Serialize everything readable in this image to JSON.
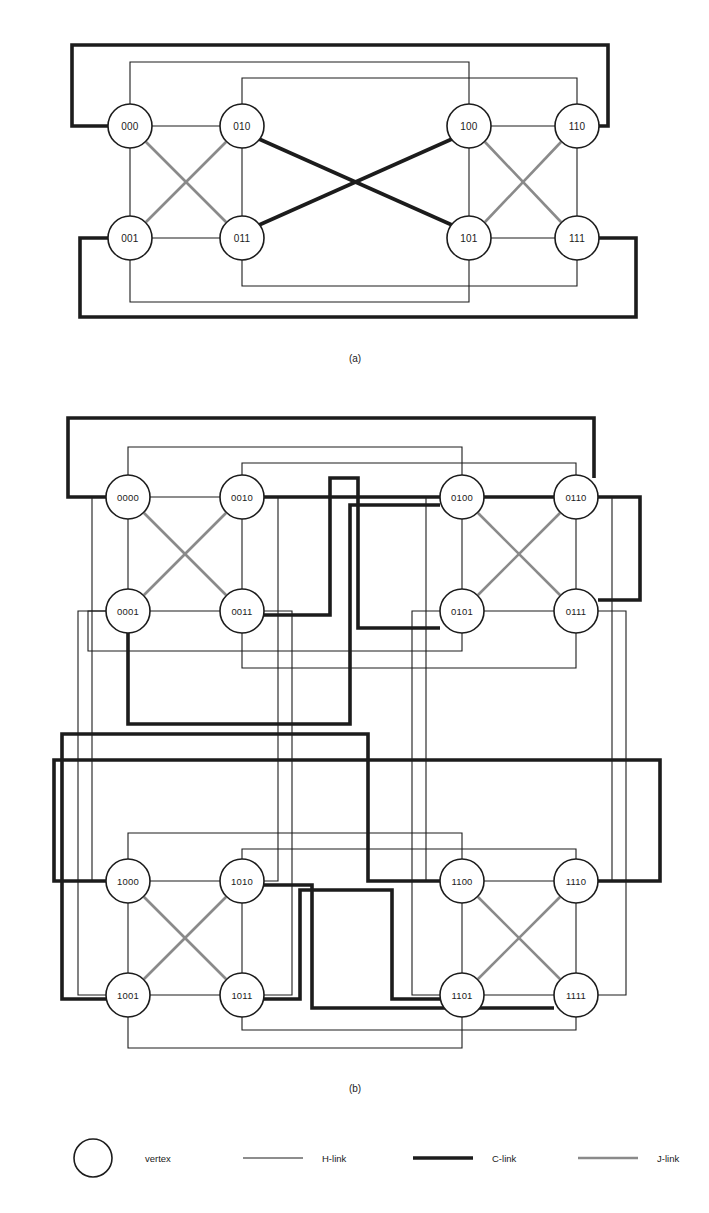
{
  "figure": {
    "captions": {
      "a": "(a)",
      "b": "(b)"
    }
  },
  "link_styles": {
    "H": {
      "name": "H-link",
      "color": "#1c1c1c",
      "width": 1.1
    },
    "C": {
      "name": "C-link",
      "color": "#1c1c1c",
      "width": 3.6
    },
    "J": {
      "name": "J-link",
      "color": "#8a8a8a",
      "width": 2.6
    }
  },
  "legend": {
    "items": [
      {
        "kind": "vertex",
        "label": "vertex"
      },
      {
        "kind": "H",
        "label": "H-link"
      },
      {
        "kind": "C",
        "label": "C-link"
      },
      {
        "kind": "J",
        "label": "J-link"
      }
    ],
    "y": 1158,
    "vertex": {
      "cx": 93,
      "cy": 1158,
      "r": 19
    },
    "vertex_label_x": 145,
    "samples": [
      {
        "kind": "H",
        "x1": 243,
        "x2": 303,
        "label_x": 322,
        "label": "H-link"
      },
      {
        "kind": "C",
        "x1": 413,
        "x2": 473,
        "label_x": 492,
        "label": "C-link"
      },
      {
        "kind": "J",
        "x1": 578,
        "x2": 638,
        "label_x": 657,
        "label": "J-link"
      }
    ]
  },
  "panel_a": {
    "caption": "(a)",
    "caption_x": 355,
    "caption_y": 362,
    "node_radius": 22,
    "nodes": [
      {
        "id": "000",
        "label": "000",
        "cx": 130,
        "cy": 126
      },
      {
        "id": "010",
        "label": "010",
        "cx": 242,
        "cy": 126
      },
      {
        "id": "001",
        "label": "001",
        "cx": 130,
        "cy": 238
      },
      {
        "id": "011",
        "label": "011",
        "cx": 242,
        "cy": 238
      },
      {
        "id": "100",
        "label": "100",
        "cx": 469,
        "cy": 126
      },
      {
        "id": "110",
        "label": "110",
        "cx": 577,
        "cy": 126
      },
      {
        "id": "101",
        "label": "101",
        "cx": 469,
        "cy": 238
      },
      {
        "id": "111",
        "label": "111",
        "cx": 577,
        "cy": 238
      }
    ],
    "links": [
      {
        "kind": "H",
        "from": "000",
        "to": "010",
        "points": "152,126 220,126"
      },
      {
        "kind": "H",
        "from": "000",
        "to": "001",
        "points": "130,148 130,216"
      },
      {
        "kind": "H",
        "from": "001",
        "to": "011",
        "points": "152,238 220,238"
      },
      {
        "kind": "H",
        "from": "010",
        "to": "011",
        "points": "242,148 242,216"
      },
      {
        "kind": "H",
        "from": "100",
        "to": "110",
        "points": "491,126 555,126"
      },
      {
        "kind": "H",
        "from": "100",
        "to": "101",
        "points": "469,148 469,216"
      },
      {
        "kind": "H",
        "from": "101",
        "to": "111",
        "points": "491,238 555,238"
      },
      {
        "kind": "H",
        "from": "110",
        "to": "111",
        "points": "577,148 577,216"
      },
      {
        "kind": "J",
        "from": "000",
        "to": "011",
        "points": "146,142 226,222"
      },
      {
        "kind": "J",
        "from": "010",
        "to": "001",
        "points": "226,142 146,222"
      },
      {
        "kind": "J",
        "from": "100",
        "to": "111",
        "points": "485,142 561,222"
      },
      {
        "kind": "J",
        "from": "110",
        "to": "101",
        "points": "561,142 485,222"
      },
      {
        "kind": "C",
        "from": "010",
        "to": "101",
        "points": "259,139 452,225"
      },
      {
        "kind": "C",
        "from": "011",
        "to": "100",
        "points": "259,225 452,139"
      },
      {
        "kind": "H",
        "from": "000",
        "to": "100",
        "points": "130,104 130,62 469,62 469,104"
      },
      {
        "kind": "H",
        "from": "010",
        "to": "110",
        "points": "242,104 242,78 577,78 577,104"
      },
      {
        "kind": "H",
        "from": "001",
        "to": "101",
        "points": "130,260 130,302 469,302 469,260"
      },
      {
        "kind": "H",
        "from": "011",
        "to": "111",
        "points": "242,260 242,286 577,286 577,260"
      },
      {
        "kind": "C",
        "from": "000",
        "to": "110",
        "points": "108,126 72,126 72,45 608,45 608,126 599,126"
      },
      {
        "kind": "C",
        "from": "001",
        "to": "111",
        "points": "108,238 80,238 80,317 636,317 636,238 599,238"
      }
    ]
  },
  "panel_b": {
    "caption": "(b)",
    "caption_x": 355,
    "caption_y": 1092,
    "node_radius": 22,
    "nodes": [
      {
        "id": "0000",
        "label": "0000",
        "cx": 128,
        "cy": 497
      },
      {
        "id": "0010",
        "label": "0010",
        "cx": 242,
        "cy": 497
      },
      {
        "id": "0001",
        "label": "0001",
        "cx": 128,
        "cy": 611
      },
      {
        "id": "0011",
        "label": "0011",
        "cx": 242,
        "cy": 611
      },
      {
        "id": "0100",
        "label": "0100",
        "cx": 462,
        "cy": 497
      },
      {
        "id": "0110",
        "label": "0110",
        "cx": 576,
        "cy": 497
      },
      {
        "id": "0101",
        "label": "0101",
        "cx": 462,
        "cy": 611
      },
      {
        "id": "0111",
        "label": "0111",
        "cx": 576,
        "cy": 611
      },
      {
        "id": "1000",
        "label": "1000",
        "cx": 128,
        "cy": 881
      },
      {
        "id": "1010",
        "label": "1010",
        "cx": 242,
        "cy": 881
      },
      {
        "id": "1001",
        "label": "1001",
        "cx": 128,
        "cy": 995
      },
      {
        "id": "1011",
        "label": "1011",
        "cx": 242,
        "cy": 995
      },
      {
        "id": "1100",
        "label": "1100",
        "cx": 462,
        "cy": 881
      },
      {
        "id": "1110",
        "label": "1110",
        "cx": 576,
        "cy": 881
      },
      {
        "id": "1101",
        "label": "1101",
        "cx": 462,
        "cy": 995
      },
      {
        "id": "1111",
        "label": "1111",
        "cx": 576,
        "cy": 995
      }
    ],
    "links": [
      {
        "kind": "H",
        "from": "0000",
        "to": "0010",
        "points": "150,497 220,497"
      },
      {
        "kind": "H",
        "from": "0000",
        "to": "0001",
        "points": "128,519 128,589"
      },
      {
        "kind": "H",
        "from": "0001",
        "to": "0011",
        "points": "150,611 220,611"
      },
      {
        "kind": "H",
        "from": "0010",
        "to": "0011",
        "points": "242,519 242,589"
      },
      {
        "kind": "J",
        "from": "0000",
        "to": "0011",
        "points": "144,513 226,595"
      },
      {
        "kind": "J",
        "from": "0010",
        "to": "0001",
        "points": "226,513 144,595"
      },
      {
        "kind": "H",
        "from": "0100",
        "to": "0110",
        "points": "484,497 554,497"
      },
      {
        "kind": "H",
        "from": "0100",
        "to": "0101",
        "points": "462,519 462,589"
      },
      {
        "kind": "H",
        "from": "0101",
        "to": "0111",
        "points": "484,611 554,611"
      },
      {
        "kind": "H",
        "from": "0110",
        "to": "0111",
        "points": "576,519 576,589"
      },
      {
        "kind": "J",
        "from": "0100",
        "to": "0111",
        "points": "478,513 560,595"
      },
      {
        "kind": "J",
        "from": "0110",
        "to": "0101",
        "points": "560,513 478,595"
      },
      {
        "kind": "H",
        "from": "1000",
        "to": "1010",
        "points": "150,881 220,881"
      },
      {
        "kind": "H",
        "from": "1000",
        "to": "1001",
        "points": "128,903 128,973"
      },
      {
        "kind": "H",
        "from": "1001",
        "to": "1011",
        "points": "150,995 220,995"
      },
      {
        "kind": "H",
        "from": "1010",
        "to": "1011",
        "points": "242,903 242,973"
      },
      {
        "kind": "J",
        "from": "1000",
        "to": "1011",
        "points": "144,897 226,979"
      },
      {
        "kind": "J",
        "from": "1010",
        "to": "1001",
        "points": "226,897 144,979"
      },
      {
        "kind": "H",
        "from": "1100",
        "to": "1110",
        "points": "484,881 554,881"
      },
      {
        "kind": "H",
        "from": "1100",
        "to": "1101",
        "points": "462,903 462,973"
      },
      {
        "kind": "H",
        "from": "1101",
        "to": "1111",
        "points": "484,995 554,995"
      },
      {
        "kind": "H",
        "from": "1110",
        "to": "1111",
        "points": "576,903 576,973"
      },
      {
        "kind": "J",
        "from": "1100",
        "to": "1111",
        "points": "478,897 560,979"
      },
      {
        "kind": "J",
        "from": "1110",
        "to": "1101",
        "points": "560,897 478,979"
      },
      {
        "kind": "H",
        "from": "0000",
        "to": "0100",
        "points": "128,475 128,447 462,447 462,475"
      },
      {
        "kind": "H",
        "from": "0010",
        "to": "0110",
        "points": "242,475 242,463 576,463 576,475"
      },
      {
        "kind": "H",
        "from": "0001",
        "to": "0101",
        "points": "106,611 88,611 88,651 462,651 462,633"
      },
      {
        "kind": "H",
        "from": "0011",
        "to": "0111",
        "points": "242,633 242,668 576,668 576,633"
      },
      {
        "kind": "H",
        "from": "1000",
        "to": "1100",
        "points": "128,859 128,833 462,833 462,859"
      },
      {
        "kind": "H",
        "from": "1010",
        "to": "1110",
        "points": "242,859 242,849 576,849 576,859"
      },
      {
        "kind": "H",
        "from": "1001",
        "to": "1101",
        "points": "128,1017 128,1048 462,1048 462,1017"
      },
      {
        "kind": "H",
        "from": "1011",
        "to": "1111",
        "points": "242,1017 242,1030 576,1030 576,1017"
      },
      {
        "kind": "H",
        "from": "0000",
        "to": "1000",
        "points": "106,497 92,497 92,881 106,881"
      },
      {
        "kind": "H",
        "from": "0001",
        "to": "1001",
        "points": "106,611 78,611 78,995 106,995"
      },
      {
        "kind": "H",
        "from": "0010",
        "to": "1010",
        "points": "264,497 278,497 278,881 264,881"
      },
      {
        "kind": "H",
        "from": "0011",
        "to": "1011",
        "points": "264,611 292,611 292,995 264,995"
      },
      {
        "kind": "H",
        "from": "0100",
        "to": "1100",
        "points": "440,497 426,497 426,881 440,881"
      },
      {
        "kind": "H",
        "from": "0101",
        "to": "1101",
        "points": "440,611 412,611 412,995 440,995"
      },
      {
        "kind": "H",
        "from": "0110",
        "to": "1110",
        "points": "598,497 612,497 612,881 598,881"
      },
      {
        "kind": "H",
        "from": "0111",
        "to": "1111",
        "points": "598,611 626,611 626,995 598,995"
      },
      {
        "kind": "C",
        "from": "0000",
        "to": "0110",
        "points": "106,497 68,497 68,418 594,418 594,478"
      },
      {
        "kind": "C",
        "from": "0010",
        "to": "0111",
        "points": "264,497 640,497 640,600 598,600"
      },
      {
        "kind": "C",
        "from": "0011",
        "to": "0101",
        "points": "264,615 330,615 330,478 358,478 358,628 440,628"
      },
      {
        "kind": "C",
        "from": "0001",
        "to": "0100",
        "points": "128,633 128,724 350,724 350,505 440,505"
      },
      {
        "kind": "C",
        "from": "1000",
        "to": "1110",
        "points": "106,881 54,881 54,760 660,760 660,881 598,881"
      },
      {
        "kind": "C",
        "from": "1010",
        "to": "1111",
        "points": "264,885 312,885 312,1008 554,1008"
      },
      {
        "kind": "C",
        "from": "1011",
        "to": "1101",
        "points": "264,999 300,999 300,890 392,890 392,999 440,999"
      },
      {
        "kind": "C",
        "from": "1001",
        "to": "1100",
        "points": "106,999 62,999 62,734 368,734 368,881 440,881"
      }
    ]
  }
}
